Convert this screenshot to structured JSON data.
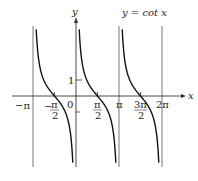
{
  "chart_data": {
    "type": "line",
    "title": "y = cot x",
    "xlabel": "x",
    "ylabel": "y",
    "function": "cot(x)",
    "xlim": [
      -3.6,
      6.9
    ],
    "ylim": [
      -4.4,
      4.4
    ],
    "asymptotes": [
      "-π",
      "0",
      "π",
      "2π"
    ],
    "x_ticks": [
      {
        "value": -3.14159,
        "label": "−π"
      },
      {
        "value": -1.5708,
        "label": "−π/2"
      },
      {
        "value": 0,
        "label": "0"
      },
      {
        "value": 1.5708,
        "label": "π/2"
      },
      {
        "value": 3.14159,
        "label": "π"
      },
      {
        "value": 4.7124,
        "label": "3π/2"
      },
      {
        "value": 6.28318,
        "label": "2π"
      }
    ],
    "y_ticks": [
      {
        "value": 1,
        "label": "1"
      },
      {
        "value": -1,
        "label": ""
      }
    ],
    "grid": false
  },
  "labels": {
    "title": "y = cot x",
    "x_axis": "x",
    "y_axis": "y",
    "neg_pi": "−π",
    "neg_pi_half_num": "π",
    "neg_pi_half_den": "2",
    "neg_sign": "−",
    "zero": "0",
    "pi_half_num": "π",
    "pi_half_den": "2",
    "pi": "π",
    "three_pi_half_num": "3π",
    "three_pi_half_den": "2",
    "two_pi": "2π",
    "one": "1"
  }
}
